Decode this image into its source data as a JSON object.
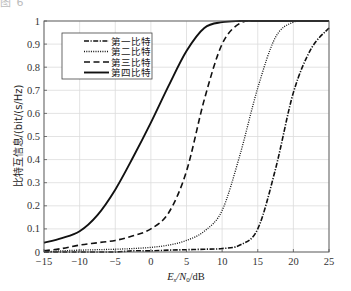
{
  "caption_fragment": "图 6",
  "chart_data": {
    "type": "line",
    "title": "",
    "xlabel": "E_s/N_0/dB",
    "xlabel_parts": {
      "main": "E",
      "sub1": "s",
      "mid": "/N",
      "sub2": "0",
      "tail": "/dB"
    },
    "ylabel": "比特互信息/(bit/(s/Hz)",
    "xlim": [
      -15,
      25
    ],
    "ylim": [
      0,
      1
    ],
    "xticks": [
      -15,
      -10,
      -5,
      0,
      5,
      10,
      15,
      20,
      25
    ],
    "xtick_labels": [
      "−15",
      "−10",
      "−5",
      "0",
      "5",
      "10",
      "15",
      "20",
      "25"
    ],
    "yticks": [
      0,
      0.1,
      0.2,
      0.3,
      0.4,
      0.5,
      0.6,
      0.7,
      0.8,
      0.9,
      1
    ],
    "ytick_labels": [
      "0",
      "0.1",
      "0.2",
      "0.3",
      "0.4",
      "0.5",
      "0.6",
      "0.7",
      "0.8",
      "0.9",
      "1"
    ],
    "grid": true,
    "legend_position": "upper left",
    "x": [
      -15,
      -12.5,
      -10,
      -7.5,
      -5,
      -2.5,
      0,
      2.5,
      5,
      7.5,
      10,
      12.5,
      15,
      17.5,
      20,
      22.5,
      25
    ],
    "series": [
      {
        "name": "第一比特",
        "style": "dashdot",
        "values": [
          0.0,
          0.0,
          0.0,
          0.0,
          0.0,
          0.005,
          0.005,
          0.008,
          0.01,
          0.012,
          0.015,
          0.03,
          0.1,
          0.36,
          0.69,
          0.88,
          0.97
        ]
      },
      {
        "name": "第二比特",
        "style": "dotted",
        "values": [
          0.0,
          0.005,
          0.008,
          0.01,
          0.012,
          0.015,
          0.02,
          0.03,
          0.05,
          0.09,
          0.18,
          0.42,
          0.71,
          0.93,
          0.995,
          1.0,
          1.0
        ]
      },
      {
        "name": "第三比特",
        "style": "dashed",
        "values": [
          0.005,
          0.015,
          0.03,
          0.04,
          0.05,
          0.07,
          0.1,
          0.17,
          0.35,
          0.66,
          0.9,
          0.99,
          1.0,
          1.0,
          1.0,
          1.0,
          1.0
        ]
      },
      {
        "name": "第四比特",
        "style": "solid",
        "values": [
          0.04,
          0.06,
          0.09,
          0.16,
          0.27,
          0.41,
          0.56,
          0.72,
          0.87,
          0.97,
          0.995,
          1.0,
          1.0,
          1.0,
          1.0,
          1.0,
          1.0
        ]
      }
    ]
  },
  "colors": {
    "line": "#111111",
    "grid": "#dcdcdc",
    "axis": "#555555",
    "legend_border": "#444444"
  }
}
